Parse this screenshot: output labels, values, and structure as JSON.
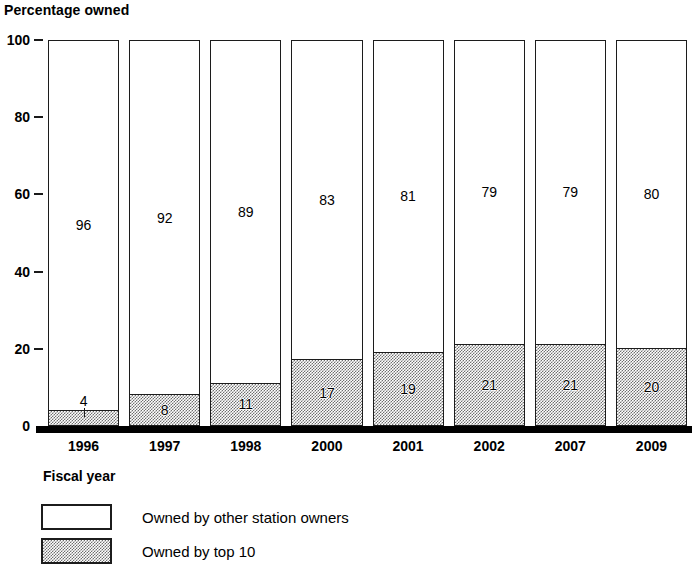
{
  "chart_data": {
    "type": "bar",
    "subtype": "stacked-vertical-100",
    "title": "",
    "xlabel": "Fiscal year",
    "ylabel": "Percentage owned",
    "ylim": [
      0,
      100
    ],
    "yticks": [
      0,
      20,
      40,
      60,
      80,
      100
    ],
    "grid": false,
    "legend_position": "bottom-left",
    "categories": [
      "1996",
      "1997",
      "1998",
      "2000",
      "2001",
      "2002",
      "2007",
      "2009"
    ],
    "series": [
      {
        "name": "Owned by other station owners",
        "fill": "white",
        "values": [
          96,
          92,
          89,
          83,
          81,
          79,
          79,
          80
        ]
      },
      {
        "name": "Owned by top 10",
        "fill": "gray-stipple",
        "values": [
          4,
          8,
          11,
          17,
          19,
          21,
          21,
          20
        ]
      }
    ],
    "colors": {
      "outline": "#1c1c1c",
      "other_station_owners": "#ffffff",
      "top_10": "#9e9e9e",
      "axis": "#000000"
    }
  },
  "axes": {
    "y_title": "Percentage owned",
    "y_ticks": [
      "100",
      "80",
      "60",
      "40",
      "20",
      "0"
    ],
    "x_title": "Fiscal year",
    "x_ticks": [
      "1996",
      "1997",
      "1998",
      "2000",
      "2001",
      "2002",
      "2007",
      "2009"
    ]
  },
  "legend": {
    "items": [
      {
        "label": "Owned by other station owners",
        "swatch": "white-box"
      },
      {
        "label": "Owned by top 10",
        "swatch": "gray-stipple-box"
      }
    ]
  },
  "bar_labels": {
    "top": [
      "96",
      "92",
      "89",
      "83",
      "81",
      "79",
      "79",
      "80"
    ],
    "bottom": [
      "4",
      "8",
      "11",
      "17",
      "19",
      "21",
      "21",
      "20"
    ]
  }
}
